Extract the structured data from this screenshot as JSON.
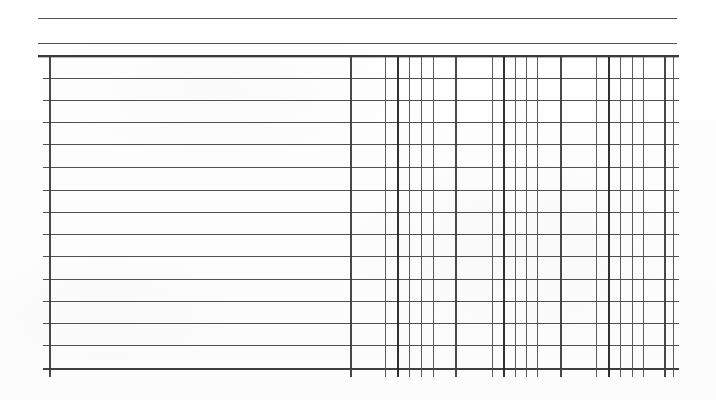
{
  "document": {
    "kind": "scanned-blank-table",
    "page_width": 716,
    "page_height": 400,
    "background_color": "#fdfdfd",
    "line_color": "#3a3a3a",
    "visible_text": "",
    "notes_label": "",
    "title_label": ""
  },
  "table": {
    "left": 43,
    "right": 679,
    "top": 55,
    "bottom": 368,
    "row_count": 14,
    "column_count": 26,
    "header_rules": [
      {
        "name": "top-rule",
        "y": 18,
        "x1": 38,
        "x2": 677,
        "thickness": 1,
        "color": "#4a4a4a"
      },
      {
        "name": "second-rule",
        "y": 43,
        "x1": 38,
        "x2": 677,
        "thickness": 1,
        "color": "#4a4a4a"
      },
      {
        "name": "table-top-rule",
        "y": 55,
        "x1": 38,
        "x2": 679,
        "thickness": 2,
        "color": "#2f2f2f"
      }
    ],
    "row_rules_y": [
      78,
      100,
      122,
      144,
      167,
      190,
      212,
      234,
      256,
      279,
      301,
      323,
      345,
      368
    ],
    "column_rules_x": [
      {
        "x": 49,
        "weight": "medium"
      },
      {
        "x": 350,
        "weight": "medium"
      },
      {
        "x": 385,
        "weight": "light"
      },
      {
        "x": 397,
        "weight": "heavy"
      },
      {
        "x": 409,
        "weight": "light"
      },
      {
        "x": 421,
        "weight": "light"
      },
      {
        "x": 433,
        "weight": "light"
      },
      {
        "x": 455,
        "weight": "medium"
      },
      {
        "x": 492,
        "weight": "light"
      },
      {
        "x": 503,
        "weight": "heavy"
      },
      {
        "x": 515,
        "weight": "light"
      },
      {
        "x": 526,
        "weight": "light"
      },
      {
        "x": 537,
        "weight": "light"
      },
      {
        "x": 560,
        "weight": "medium"
      },
      {
        "x": 596,
        "weight": "light"
      },
      {
        "x": 608,
        "weight": "heavy"
      },
      {
        "x": 620,
        "weight": "light"
      },
      {
        "x": 632,
        "weight": "light"
      },
      {
        "x": 643,
        "weight": "light"
      },
      {
        "x": 664,
        "weight": "medium"
      },
      {
        "x": 673,
        "weight": "light"
      }
    ],
    "vertical_extent": {
      "top": 57,
      "bottom": 377
    },
    "wide_left_column": {
      "from_x": 49,
      "to_x": 350,
      "label": ""
    },
    "cells": [
      [
        "",
        "",
        "",
        "",
        "",
        "",
        "",
        "",
        "",
        "",
        "",
        "",
        "",
        "",
        "",
        "",
        "",
        "",
        "",
        "",
        ""
      ],
      [
        "",
        "",
        "",
        "",
        "",
        "",
        "",
        "",
        "",
        "",
        "",
        "",
        "",
        "",
        "",
        "",
        "",
        "",
        "",
        "",
        ""
      ],
      [
        "",
        "",
        "",
        "",
        "",
        "",
        "",
        "",
        "",
        "",
        "",
        "",
        "",
        "",
        "",
        "",
        "",
        "",
        "",
        "",
        ""
      ],
      [
        "",
        "",
        "",
        "",
        "",
        "",
        "",
        "",
        "",
        "",
        "",
        "",
        "",
        "",
        "",
        "",
        "",
        "",
        "",
        "",
        ""
      ],
      [
        "",
        "",
        "",
        "",
        "",
        "",
        "",
        "",
        "",
        "",
        "",
        "",
        "",
        "",
        "",
        "",
        "",
        "",
        "",
        "",
        ""
      ],
      [
        "",
        "",
        "",
        "",
        "",
        "",
        "",
        "",
        "",
        "",
        "",
        "",
        "",
        "",
        "",
        "",
        "",
        "",
        "",
        "",
        ""
      ],
      [
        "",
        "",
        "",
        "",
        "",
        "",
        "",
        "",
        "",
        "",
        "",
        "",
        "",
        "",
        "",
        "",
        "",
        "",
        "",
        "",
        ""
      ],
      [
        "",
        "",
        "",
        "",
        "",
        "",
        "",
        "",
        "",
        "",
        "",
        "",
        "",
        "",
        "",
        "",
        "",
        "",
        "",
        "",
        ""
      ],
      [
        "",
        "",
        "",
        "",
        "",
        "",
        "",
        "",
        "",
        "",
        "",
        "",
        "",
        "",
        "",
        "",
        "",
        "",
        "",
        "",
        ""
      ],
      [
        "",
        "",
        "",
        "",
        "",
        "",
        "",
        "",
        "",
        "",
        "",
        "",
        "",
        "",
        "",
        "",
        "",
        "",
        "",
        "",
        ""
      ],
      [
        "",
        "",
        "",
        "",
        "",
        "",
        "",
        "",
        "",
        "",
        "",
        "",
        "",
        "",
        "",
        "",
        "",
        "",
        "",
        "",
        ""
      ],
      [
        "",
        "",
        "",
        "",
        "",
        "",
        "",
        "",
        "",
        "",
        "",
        "",
        "",
        "",
        "",
        "",
        "",
        "",
        "",
        "",
        ""
      ],
      [
        "",
        "",
        "",
        "",
        "",
        "",
        "",
        "",
        "",
        "",
        "",
        "",
        "",
        "",
        "",
        "",
        "",
        "",
        "",
        "",
        ""
      ],
      [
        "",
        "",
        "",
        "",
        "",
        "",
        "",
        "",
        "",
        "",
        "",
        "",
        "",
        "",
        "",
        "",
        "",
        "",
        "",
        "",
        ""
      ]
    ]
  }
}
